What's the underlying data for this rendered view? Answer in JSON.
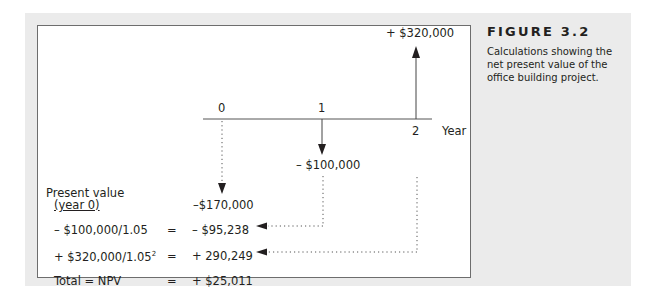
{
  "figure": {
    "title": "FIGURE 3.2",
    "caption": "Calculations showing the net present value of the office building project."
  },
  "timeline": {
    "axis_label": "Year",
    "ticks": [
      "0",
      "1",
      "2"
    ],
    "cash_flows": [
      {
        "year": "0",
        "label": "–$170,000",
        "direction": "down"
      },
      {
        "year": "1",
        "label": "– $100,000",
        "direction": "down"
      },
      {
        "year": "2",
        "label": "+ $320,000",
        "direction": "up"
      }
    ]
  },
  "table": {
    "header_line1": "Present value",
    "header_line2": "(year 0)",
    "rows": [
      {
        "formula": "– $100,000/1.05",
        "eq": "=",
        "value": "– $95,238"
      },
      {
        "formula": "+ $320,000/1.05",
        "exp": "2",
        "eq": "=",
        "value": "+ 290,249"
      },
      {
        "formula": "Total = NPV",
        "eq": "=",
        "value": "+ $25,011"
      }
    ]
  },
  "colors": {
    "panel_bg": "#ebebeb",
    "ink": "#231f20",
    "box_border": "#6d6d6d"
  }
}
